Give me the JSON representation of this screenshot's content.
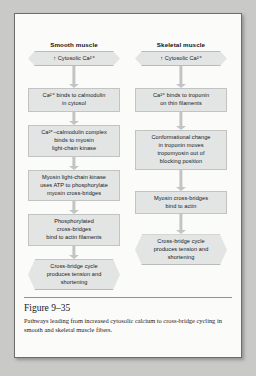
{
  "figure": {
    "number": "Figure 9–35",
    "caption": "Pathways leading from increased cytosolic calcium to cross-bridge cycling in smooth and skeletal muscle fibers."
  },
  "columns": [
    {
      "id": "smooth",
      "title": "Smooth muscle",
      "nodes": [
        {
          "shape": "hexagon",
          "text": "↑ Cytosolic Ca²⁺"
        },
        {
          "shape": "rect",
          "text": "Ca²⁺ binds to calmodulin\nin cytosol"
        },
        {
          "shape": "rect",
          "text": "Ca²⁺–calmodulin complex\nbinds to myosin\nlight-chain kinase"
        },
        {
          "shape": "rect",
          "text": "Myosin light-chain kinase\nuses ATP to phosphorylate\nmyosin cross-bridges"
        },
        {
          "shape": "rect",
          "text": "Phosphorylated\ncross-bridges\nbind to actin filaments"
        },
        {
          "shape": "hexagon",
          "text": "Cross-bridge cycle\nproduces tension and\nshortening"
        }
      ]
    },
    {
      "id": "skeletal",
      "title": "Skeletal muscle",
      "nodes": [
        {
          "shape": "hexagon",
          "text": "↑ Cytosolic Ca²⁺"
        },
        {
          "shape": "rect",
          "text": "Ca²⁺ binds to troponin\non thin filaments"
        },
        {
          "shape": "rect",
          "text": "Conformational change\nin troponin moves\ntropomyosin out of\nblocking position"
        },
        {
          "shape": "rect",
          "text": "Myosin cross-bridges\nbind to actin"
        },
        {
          "shape": "hexagon",
          "text": "Cross-bridge cycle\nproduces tension and\nshortening"
        }
      ]
    }
  ],
  "layout": {
    "smooth": {
      "gaps": [
        22,
        13,
        13,
        13,
        13
      ],
      "top": 0
    },
    "skeletal": {
      "gaps": [
        22,
        18,
        21,
        20
      ],
      "top": 0
    }
  },
  "colors": {
    "node_fill": "#e3e4e4",
    "node_border": "#c2c4c4",
    "connector": "#c3c5c5",
    "page": "#fbfbfa",
    "page_border": "#6d6d6d",
    "backdrop": "#c9c9c7"
  }
}
